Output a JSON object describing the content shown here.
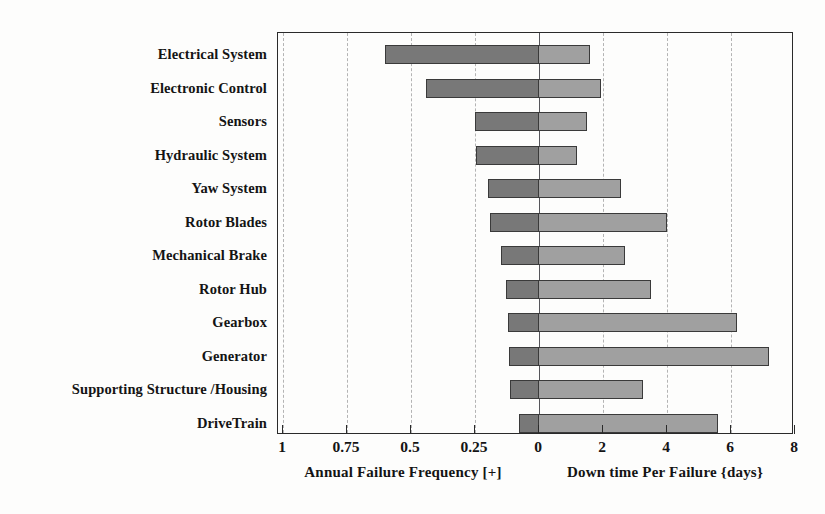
{
  "chart_data": {
    "type": "bar",
    "subtype": "diverging-bidirectional-horizontal-bar",
    "title": "",
    "orientation": "horizontal",
    "grid": true,
    "legend_position": "none",
    "categories": [
      "Electrical System",
      "Electronic Control",
      "Sensors",
      "Hydraulic System",
      "Yaw System",
      "Rotor Blades",
      "Mechanical Brake",
      "Rotor Hub",
      "Gearbox",
      "Generator",
      "Supporting Structure /Housing",
      "DriveTrain"
    ],
    "series": [
      {
        "name": "Annual Failure Frequency [+]",
        "side": "left",
        "color": "#787878",
        "axis_label": "Annual Failure Frequency [+]",
        "axis_ticks": [
          "1",
          "0.75",
          "0.5",
          "0.25",
          "0"
        ],
        "axis_tick_values": [
          1,
          0.75,
          0.5,
          0.25,
          0
        ],
        "axis_min": 0,
        "axis_max": 1,
        "values": [
          0.6,
          0.44,
          0.25,
          0.245,
          0.2,
          0.19,
          0.15,
          0.13,
          0.12,
          0.117,
          0.113,
          0.078
        ]
      },
      {
        "name": "Down time Per Failure {days}",
        "side": "right",
        "color": "#a0a0a0",
        "axis_label": "Down time Per Failure {days}",
        "axis_ticks": [
          "0",
          "2",
          "4",
          "6",
          "8"
        ],
        "axis_tick_values": [
          0,
          2,
          4,
          6,
          8
        ],
        "axis_min": 0,
        "axis_max": 8,
        "values": [
          1.6,
          1.95,
          1.5,
          1.2,
          2.55,
          4.0,
          2.7,
          3.5,
          6.2,
          7.2,
          3.25,
          5.6
        ]
      }
    ],
    "xlabel_left": "Annual Failure Frequency [+]",
    "xlabel_right": "Down time Per Failure {days}",
    "ylabel": ""
  },
  "axis": {
    "left_caption": "Annual Failure Frequency [+]",
    "right_caption": "Down time Per Failure {days}",
    "tick_labels": [
      "1",
      "0.75",
      "0.5",
      "0.25",
      "0",
      "2",
      "4",
      "6",
      "8"
    ]
  },
  "colors": {
    "failure_frequency_bar": "#787878",
    "downtime_bar": "#a0a0a0",
    "bar_border": "#3a3a3a",
    "frame": "#2a2a2a",
    "gridline": "#b4b4b4",
    "zeroline": "#55555a",
    "background": "#fdfdfc",
    "text": "#141414"
  }
}
